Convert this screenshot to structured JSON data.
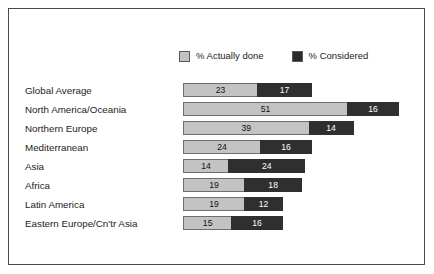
{
  "chart_data": {
    "type": "bar",
    "orientation": "horizontal",
    "stacked": true,
    "title": "",
    "subtitle": "",
    "xlabel": "",
    "ylabel": "",
    "grid": false,
    "legend_position": "top-center",
    "xlim": [
      0,
      67
    ],
    "categories": [
      "Global Average",
      "North America/Oceania",
      "Northern Europe",
      "Mediterranean",
      "Asia",
      "Africa",
      "Latin America",
      "Eastern Europe/Cn'tr Asia"
    ],
    "series": [
      {
        "name": "% Actually done",
        "color": "#c3c3c3",
        "values": [
          23,
          51,
          39,
          24,
          14,
          19,
          19,
          15
        ]
      },
      {
        "name": "% Considered",
        "color": "#2f2f2f",
        "values": [
          17,
          16,
          14,
          16,
          24,
          18,
          12,
          16
        ]
      }
    ]
  },
  "legend": {
    "entries": [
      {
        "label": "% Actually done",
        "swatch": "done"
      },
      {
        "label": "% Considered",
        "swatch": "consid"
      }
    ]
  },
  "scale": {
    "px_per_unit": 3.22
  }
}
